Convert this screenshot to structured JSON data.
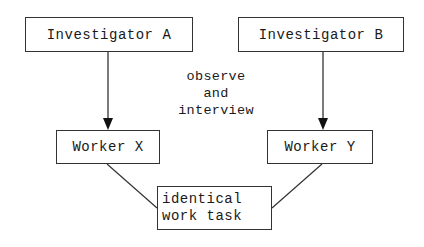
{
  "diagram": {
    "nodes": {
      "investigator_a": "Investigator A",
      "investigator_b": "Investigator B",
      "worker_x": "Worker X",
      "worker_y": "Worker Y",
      "task_line1": "identical",
      "task_line2": "work task"
    },
    "edge_label": {
      "line1": "observe",
      "line2": "and",
      "line3": "interview"
    },
    "edges": [
      {
        "from": "Investigator A",
        "to": "Worker X",
        "type": "arrow"
      },
      {
        "from": "Investigator B",
        "to": "Worker Y",
        "type": "arrow"
      },
      {
        "from": "Worker X",
        "to": "identical work task",
        "type": "line"
      },
      {
        "from": "Worker Y",
        "to": "identical work task",
        "type": "line"
      }
    ]
  }
}
